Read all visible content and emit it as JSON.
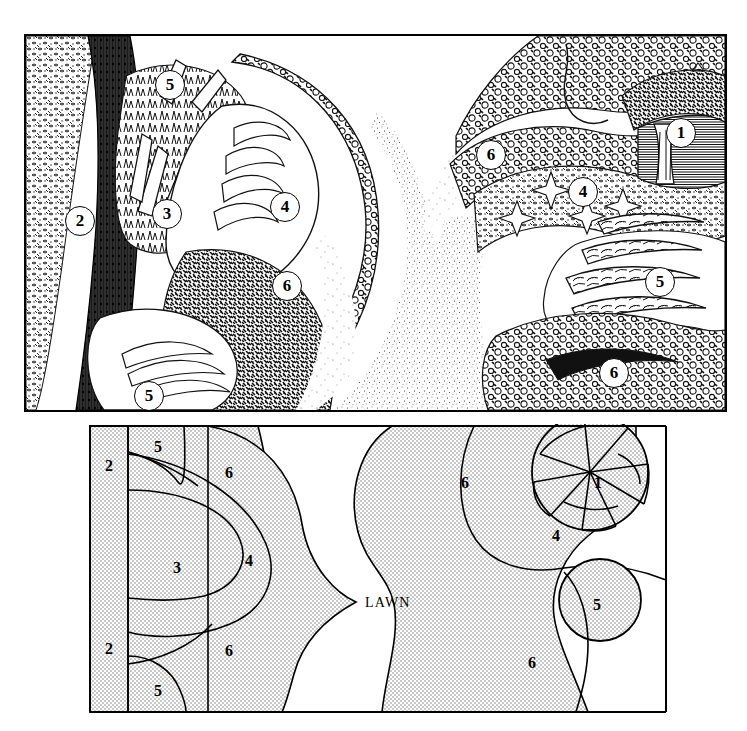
{
  "figure": {
    "type": "garden-border-illustration-and-plan",
    "panels": [
      {
        "name": "perspective-illustration",
        "style": "pen-and-ink line drawing"
      },
      {
        "name": "planting-plan",
        "style": "shaded plan view"
      }
    ]
  },
  "illustration": {
    "callouts": [
      {
        "key": "c5a",
        "label": "5",
        "x": 129,
        "y": 34
      },
      {
        "key": "c2",
        "label": "2",
        "x": 39,
        "y": 170
      },
      {
        "key": "c3",
        "label": "3",
        "x": 126,
        "y": 163
      },
      {
        "key": "c4a",
        "label": "4",
        "x": 244,
        "y": 156
      },
      {
        "key": "c6a",
        "label": "6",
        "x": 246,
        "y": 235
      },
      {
        "key": "c5b",
        "label": "5",
        "x": 108,
        "y": 345
      },
      {
        "key": "c6b",
        "label": "6",
        "x": 450,
        "y": 104
      },
      {
        "key": "c4b",
        "label": "4",
        "x": 542,
        "y": 141
      },
      {
        "key": "c1",
        "label": "1",
        "x": 640,
        "y": 82
      },
      {
        "key": "c5c",
        "label": "5",
        "x": 619,
        "y": 231
      },
      {
        "key": "c6c",
        "label": "6",
        "x": 573,
        "y": 322
      }
    ]
  },
  "plan": {
    "lawn_label": "LAWN",
    "lawn_label_pos": {
      "x": 277,
      "y": 178
    },
    "bed_fill": "#e3e3e3",
    "line_color": "#000000",
    "labels": [
      {
        "key": "p2a",
        "label": "2",
        "x": 17,
        "y": 33
      },
      {
        "key": "p5a",
        "label": "5",
        "x": 66,
        "y": 14
      },
      {
        "key": "p6a",
        "label": "6",
        "x": 137,
        "y": 40
      },
      {
        "key": "p3",
        "label": "3",
        "x": 85,
        "y": 135
      },
      {
        "key": "p4a",
        "label": "4",
        "x": 157,
        "y": 128
      },
      {
        "key": "p2b",
        "label": "2",
        "x": 17,
        "y": 216
      },
      {
        "key": "p6b",
        "label": "6",
        "x": 137,
        "y": 218
      },
      {
        "key": "p5b",
        "label": "5",
        "x": 66,
        "y": 258
      },
      {
        "key": "p6c",
        "label": "6",
        "x": 373,
        "y": 50
      },
      {
        "key": "p1",
        "label": "1",
        "x": 506,
        "y": 50
      },
      {
        "key": "p4b",
        "label": "4",
        "x": 464,
        "y": 103
      },
      {
        "key": "p5c",
        "label": "5",
        "x": 505,
        "y": 172
      },
      {
        "key": "p6d",
        "label": "6",
        "x": 440,
        "y": 230
      }
    ],
    "zones": [
      {
        "id": "1",
        "name": "specimen-tree"
      },
      {
        "id": "2",
        "name": "hedge-strip"
      },
      {
        "id": "3",
        "name": "inner-bed"
      },
      {
        "id": "4",
        "name": "mid-bed"
      },
      {
        "id": "5",
        "name": "accent-clump"
      },
      {
        "id": "6",
        "name": "outer-bed"
      }
    ]
  }
}
